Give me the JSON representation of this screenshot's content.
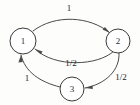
{
  "diagram": {
    "type": "directed-graph",
    "title": "",
    "background_color": "#fdfdfc",
    "stroke_color": "#4a4a4a",
    "node_fill_color": "#ffffff",
    "text_color": "#232323",
    "nodes": [
      {
        "id": "1",
        "label": "1",
        "cx": 23,
        "cy": 41,
        "r": 13
      },
      {
        "id": "2",
        "label": "2",
        "cx": 118,
        "cy": 41,
        "r": 12
      },
      {
        "id": "3",
        "label": "3",
        "cx": 72,
        "cy": 89,
        "r": 12
      }
    ],
    "edges": [
      {
        "from": "1",
        "to": "2",
        "label": "1",
        "label_x": 69,
        "label_y": 9,
        "curve": "upper"
      },
      {
        "from": "2",
        "to": "1",
        "label": "1/2",
        "label_x": 71,
        "label_y": 64,
        "curve": "lower"
      },
      {
        "from": "2",
        "to": "3",
        "label": "1/2",
        "label_x": 121,
        "label_y": 78,
        "curve": "right"
      },
      {
        "from": "3",
        "to": "1",
        "label": "1",
        "label_x": 27,
        "label_y": 79,
        "curve": "left"
      }
    ]
  },
  "labels": {
    "node_1": "1",
    "node_2": "2",
    "node_3": "3",
    "edge_1_to_2": "1",
    "edge_2_to_1": "1/2",
    "edge_2_to_3": "1/2",
    "edge_3_to_1": "1"
  }
}
